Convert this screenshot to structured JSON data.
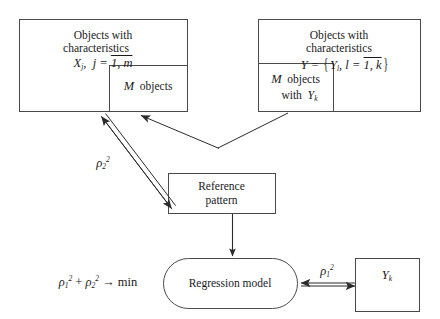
{
  "figure": {
    "background_color": "#ffffff",
    "line_color": "#3a3a3a",
    "text_color": "#1a1a1a",
    "width": 440,
    "height": 319
  },
  "boxes": {
    "objects_x": {
      "name": "objects-with-characteristics-x",
      "line1": "Objects with",
      "line2": "characteristics",
      "formula_var": "X",
      "formula_sub": "j",
      "formula_rest": "j =",
      "formula_range": "1, m",
      "shape": "rectangle"
    },
    "objects_x_inner": {
      "name": "m-objects-subbox",
      "count_symbol": "M",
      "label": "objects",
      "shape": "rectangle"
    },
    "objects_y": {
      "name": "objects-with-characteristics-y",
      "line1": "Objects with",
      "line2": "characteristics",
      "formula_lhs": "Y =",
      "formula_member": "Y",
      "formula_member_sub": "l",
      "formula_index": "l =",
      "formula_range": "1, k",
      "shape": "rectangle"
    },
    "objects_y_inner": {
      "name": "m-objects-with-yk-subbox",
      "count_symbol": "M",
      "label": "objects",
      "label2": "with",
      "var": "Y",
      "var_sub": "k",
      "shape": "rectangle"
    },
    "reference_pattern": {
      "name": "reference-pattern-box",
      "line1": "Reference",
      "line2": "pattern",
      "shape": "rectangle"
    },
    "regression_model": {
      "name": "regression-model-node",
      "label": "Regression model",
      "shape": "stadium"
    },
    "yk_output": {
      "name": "yk-output-box",
      "var": "Y",
      "var_sub": "k",
      "shape": "rectangle"
    }
  },
  "labels": {
    "rho2": {
      "name": "rho-2-squared-label",
      "symbol": "ρ",
      "sub": "2",
      "sup": "2"
    },
    "rho1": {
      "name": "rho-1-squared-label",
      "symbol": "ρ",
      "sub": "1",
      "sup": "2"
    },
    "objective": {
      "name": "objective-function",
      "term1_symbol": "ρ",
      "term1_sub": "1",
      "term1_sup": "2",
      "plus": "+",
      "term2_symbol": "ρ",
      "term2_sub": "2",
      "term2_sup": "2",
      "arrow": "→",
      "target": "min"
    }
  },
  "connectors": [
    {
      "name": "arrow-reference-pattern-to-objects-x",
      "style": "double-headed-open",
      "from": "reference-pattern-box",
      "to": "objects-with-characteristics-x",
      "label": "rho2"
    },
    {
      "name": "connector-objects-y-to-objects-x",
      "style": "single-arrow-v",
      "from": "m-objects-with-yk-subbox",
      "to": "objects-with-characteristics-x"
    },
    {
      "name": "arrow-reference-pattern-to-regression-model",
      "style": "single-arrow",
      "from": "reference-pattern-box",
      "to": "regression-model-node"
    },
    {
      "name": "arrow-regression-model-to-yk",
      "style": "double-headed-open",
      "from": "regression-model-node",
      "to": "yk-output-box",
      "label": "rho1"
    }
  ]
}
